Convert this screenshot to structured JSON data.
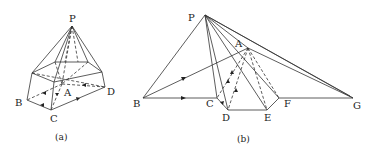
{
  "figure_a": {
    "caption": "(a)",
    "labels": {
      "P": "P",
      "A": "A",
      "B": "B",
      "C": "C",
      "D": "D"
    }
  },
  "figure_b": {
    "caption": "(b)",
    "labels": {
      "P": "P",
      "A": "A",
      "B": "B",
      "C": "C",
      "D": "D",
      "E": "E",
      "F": "F",
      "G": "G"
    }
  }
}
